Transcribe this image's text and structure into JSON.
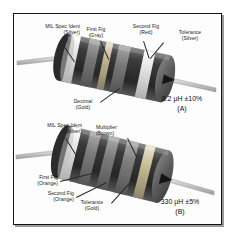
{
  "figure": {
    "background_color": "#ffffff",
    "frame_color": "#141414"
  },
  "parts": [
    {
      "id": "A",
      "designator": "(A)",
      "value_text": "8.2 µH ±10%",
      "labels": [
        {
          "name": "mil-spec-ident",
          "line1": "MIL Spec Ident",
          "line2": "(Silver)"
        },
        {
          "name": "first-fig",
          "line1": "First Fig",
          "line2": "(Gray)"
        },
        {
          "name": "second-fig",
          "line1": "Second Fig",
          "line2": "(Red)"
        },
        {
          "name": "tolerance",
          "line1": "Tolerance",
          "line2": "(Silver)"
        },
        {
          "name": "decimal",
          "line1": "Decimal",
          "line2": "(Gold)"
        }
      ],
      "bands": [
        {
          "name": "mil-spec-ident",
          "color_name": "Silver",
          "hex": "#d8d8d8"
        },
        {
          "name": "first-fig",
          "color_name": "Gray",
          "hex": "#8d8d8d"
        },
        {
          "name": "decimal",
          "color_name": "Gold",
          "hex": "#b9aa7a"
        },
        {
          "name": "second-fig",
          "color_name": "Red",
          "hex": "#5e5e5e"
        },
        {
          "name": "tolerance",
          "color_name": "Silver",
          "hex": "#dcdcdc"
        }
      ]
    },
    {
      "id": "B",
      "designator": "(B)",
      "value_text": "330 µH ±5%",
      "labels": [
        {
          "name": "mil-spec-ident",
          "line1": "MIL Spec Ident",
          "line2": "(Silver)"
        },
        {
          "name": "multiplier",
          "line1": "Multiplier",
          "line2": "(Brown)"
        },
        {
          "name": "first-fig",
          "line1": "First Fig",
          "line2": "(Orange)"
        },
        {
          "name": "second-fig",
          "line1": "Second Fig",
          "line2": "(Orange)"
        },
        {
          "name": "tolerance",
          "line1": "Tolerance",
          "line2": "(Gold)"
        }
      ],
      "bands": [
        {
          "name": "mil-spec-ident",
          "color_name": "Silver",
          "hex": "#dcdcdc"
        },
        {
          "name": "first-fig",
          "color_name": "Orange",
          "hex": "#9a9a9a"
        },
        {
          "name": "second-fig",
          "color_name": "Orange",
          "hex": "#9a9a9a"
        },
        {
          "name": "multiplier",
          "color_name": "Brown",
          "hex": "#6a6a6a"
        },
        {
          "name": "tolerance",
          "color_name": "Gold",
          "hex": "#c4b68a"
        }
      ]
    }
  ]
}
